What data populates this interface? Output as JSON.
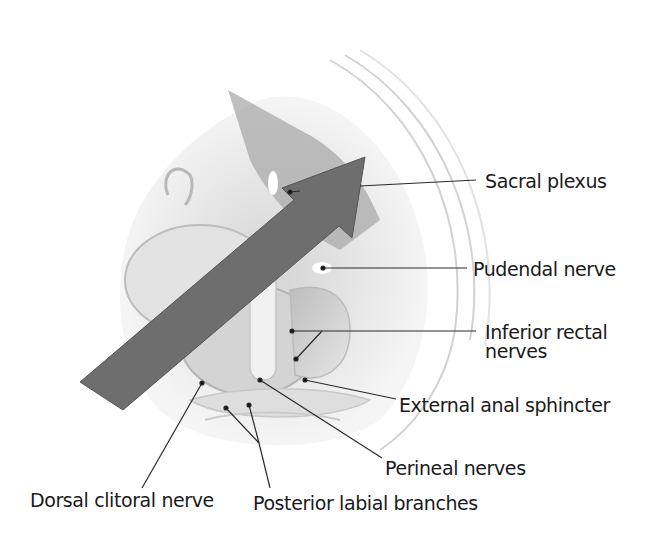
{
  "figure": {
    "arrow": {
      "color": "#6e6e6e",
      "direction": "up-right"
    },
    "labels": [
      {
        "id": "sacral_plexus",
        "text": "Sacral plexus"
      },
      {
        "id": "pudendal_nerve",
        "text": "Pudendal nerve"
      },
      {
        "id": "inferior_rectal_nerves_line1",
        "text": "Inferior rectal"
      },
      {
        "id": "inferior_rectal_nerves_line2",
        "text": "nerves"
      },
      {
        "id": "external_anal_sphincter",
        "text": "External anal sphincter"
      },
      {
        "id": "perineal_nerves",
        "text": "Perineal nerves"
      },
      {
        "id": "dorsal_clitoral_nerve",
        "text": "Dorsal clitoral nerve"
      },
      {
        "id": "posterior_labial_branches",
        "text": "Posterior labial branches"
      }
    ]
  }
}
